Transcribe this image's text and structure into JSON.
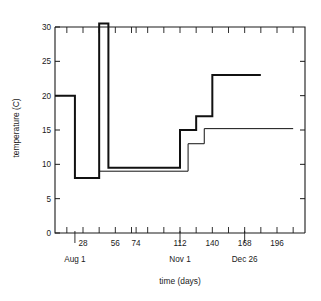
{
  "chart_data": {
    "type": "line",
    "title": "",
    "xlabel": "time (days)",
    "ylabel": "temperature (C)",
    "xlim": [
      0,
      210
    ],
    "ylim": [
      0,
      32
    ],
    "grid": false,
    "legend_position": "right-inline",
    "y_ticks": [
      0,
      5,
      10,
      15,
      20,
      25,
      30
    ],
    "y_tick_labels": [
      "0",
      "5",
      "10",
      "15",
      "20",
      "25",
      "30"
    ],
    "x_ticks_major": [
      28,
      56,
      74,
      112,
      140,
      168,
      196
    ],
    "x_tick_labels": [
      "28",
      "56",
      "74",
      "112",
      "140",
      "168",
      "196"
    ],
    "x_ticks_minor": [
      14,
      42,
      70,
      84,
      98,
      126,
      154,
      182,
      210
    ],
    "x_secondary_labels": [
      {
        "value": 21,
        "label": "Aug 1"
      },
      {
        "value": 112,
        "label": "Nov 1"
      },
      {
        "value": 168,
        "label": "Dec 26"
      }
    ],
    "series": [
      {
        "name": "tulip",
        "style": "step-post",
        "linewidth": "thick",
        "label_at": {
          "x": 240,
          "y": 23
        },
        "points": [
          {
            "x": 0,
            "y": 20
          },
          {
            "x": 21,
            "y": 20
          },
          {
            "x": 21,
            "y": 8
          },
          {
            "x": 42,
            "y": 8
          },
          {
            "x": 42,
            "y": 30.5
          },
          {
            "x": 50,
            "y": 30.5
          },
          {
            "x": 50,
            "y": 9.5
          },
          {
            "x": 112,
            "y": 9.5
          },
          {
            "x": 112,
            "y": 15
          },
          {
            "x": 126,
            "y": 15
          },
          {
            "x": 126,
            "y": 17
          },
          {
            "x": 140,
            "y": 17
          },
          {
            "x": 140,
            "y": 23
          },
          {
            "x": 182,
            "y": 23
          }
        ]
      },
      {
        "name": "wedgewood iris",
        "style": "step-post",
        "linewidth": "thin",
        "label_at": {
          "x": 240,
          "y": 16.6
        },
        "points": [
          {
            "x": 42,
            "y": 9
          },
          {
            "x": 119,
            "y": 9
          },
          {
            "x": 119,
            "y": 13
          },
          {
            "x": 133,
            "y": 13
          },
          {
            "x": 133,
            "y": 15.2
          },
          {
            "x": 210,
            "y": 15.2
          }
        ]
      }
    ]
  }
}
